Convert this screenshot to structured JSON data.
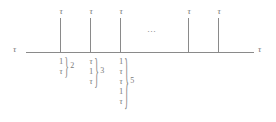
{
  "figure": {
    "axis": {
      "left_label": "τ",
      "right_label": "τ",
      "ellipsis": "⋯"
    },
    "ticks": [
      {
        "label": "τ",
        "x": 60
      },
      {
        "label": "τ",
        "x": 90
      },
      {
        "label": "τ",
        "x": 120
      },
      {
        "label": "τ",
        "x": 188
      },
      {
        "label": "τ",
        "x": 218
      }
    ],
    "groups": [
      {
        "name": "group-2",
        "x": 58,
        "count": "2",
        "brace": "}",
        "symbols": [
          "1",
          "τ"
        ]
      },
      {
        "name": "group-3",
        "x": 88,
        "count": "3",
        "brace": "}",
        "symbols": [
          "τ",
          "1",
          "τ"
        ]
      },
      {
        "name": "group-5",
        "x": 118,
        "count": "5",
        "brace": "}",
        "symbols": [
          "1",
          "τ",
          "τ",
          "1",
          "τ"
        ]
      }
    ]
  },
  "colors": {
    "stroke": "#8a8a8a",
    "text": "#7a7a7a",
    "background": "#ffffff"
  }
}
